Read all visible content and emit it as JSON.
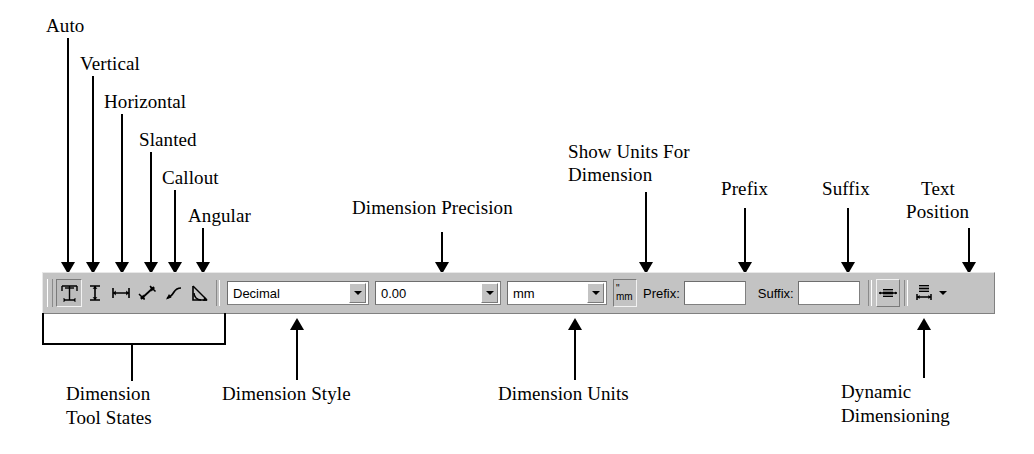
{
  "annotations": {
    "auto": "Auto",
    "vertical": "Vertical",
    "horizontal": "Horizontal",
    "slanted": "Slanted",
    "callout": "Callout",
    "angular": "Angular",
    "dimension_precision": "Dimension Precision",
    "show_units_line1": "Show Units For",
    "show_units_line2": "Dimension",
    "prefix": "Prefix",
    "suffix": "Suffix",
    "text_position_line1": "Text",
    "text_position_line2": "Position",
    "tool_states_line1": "Dimension",
    "tool_states_line2": "Tool States",
    "dimension_style": "Dimension Style",
    "dimension_units": "Dimension Units",
    "dynamic_line1": "Dynamic",
    "dynamic_line2": "Dimensioning"
  },
  "toolbar": {
    "buttons": [
      {
        "name": "auto-dimension-button",
        "icon": "auto-dimension-icon",
        "state": "pressed"
      },
      {
        "name": "vertical-dimension-button",
        "icon": "vertical-dimension-icon",
        "state": "flat"
      },
      {
        "name": "horizontal-dimension-button",
        "icon": "horizontal-dimension-icon",
        "state": "flat"
      },
      {
        "name": "slanted-dimension-button",
        "icon": "slanted-dimension-icon",
        "state": "flat"
      },
      {
        "name": "callout-dimension-button",
        "icon": "callout-dimension-icon",
        "state": "flat"
      },
      {
        "name": "angular-dimension-button",
        "icon": "angular-dimension-icon",
        "state": "flat"
      }
    ],
    "style_combo": {
      "value": "Decimal",
      "options": [
        "Decimal",
        "Fractional",
        "Architectural",
        "Engineering"
      ]
    },
    "precision_combo": {
      "value": "0.00",
      "options": [
        "0",
        "0.0",
        "0.00",
        "0.000",
        "0.0000"
      ]
    },
    "units_combo": {
      "value": "mm",
      "options": [
        "mm",
        "cm",
        "m",
        "in",
        "ft"
      ]
    },
    "show_units_button": {
      "top_glyph": "\"",
      "bottom_glyph": "mm"
    },
    "prefix_label": "Prefix:",
    "prefix_value": "",
    "prefix_placeholder": "",
    "suffix_label": "Suffix:",
    "suffix_value": "",
    "suffix_placeholder": "",
    "dynamic_button_icon": "dynamic-dimensioning-icon",
    "text_position_button_icon": "text-position-icon",
    "text_position_caret": "▾"
  },
  "colors": {
    "toolbar_face": "#c3c3c3",
    "field_bg": "#ffffff",
    "shadow": "#808080",
    "highlight": "#ffffff",
    "ink": "#000000"
  }
}
